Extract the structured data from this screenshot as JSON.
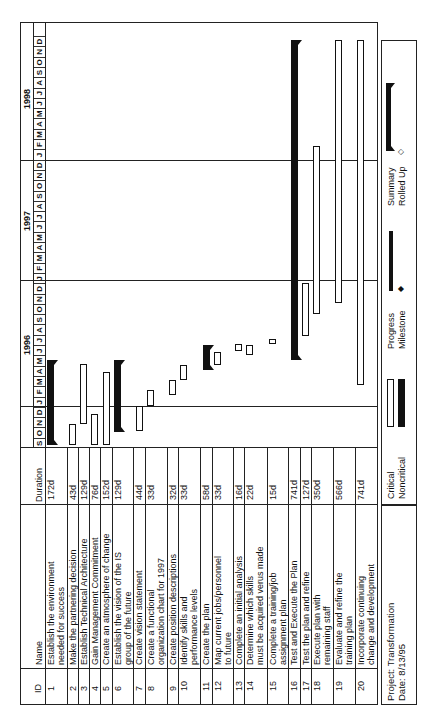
{
  "header": {
    "id_label": "ID",
    "name_label": "Name",
    "duration_label": "Duration",
    "years": [
      {
        "label": "1996",
        "start_month_index": 4
      },
      {
        "label": "1997",
        "start_month_index": 16
      },
      {
        "label": "1998",
        "start_month_index": 28
      }
    ],
    "months": [
      "S",
      "O",
      "N",
      "D",
      "J",
      "F",
      "M",
      "A",
      "M",
      "J",
      "J",
      "A",
      "S",
      "O",
      "N",
      "D",
      "J",
      "F",
      "M",
      "A",
      "M",
      "J",
      "J",
      "A",
      "S",
      "O",
      "N",
      "D",
      "J",
      "F",
      "M",
      "A",
      "M",
      "J",
      "J",
      "A",
      "S",
      "O",
      "N",
      "D"
    ]
  },
  "tasks": [
    {
      "id": "1",
      "name": [
        "Establish the environment",
        "needed for success"
      ],
      "duration": "172d",
      "type": "summary"
    },
    {
      "id": "2",
      "name": [
        "Make the partnering decision"
      ],
      "duration": "43d",
      "type": "task"
    },
    {
      "id": "3",
      "name": [
        "Establish Technical Architecture"
      ],
      "duration": "129d",
      "type": "task"
    },
    {
      "id": "4",
      "name": [
        "Gain Management Commitment"
      ],
      "duration": "76d",
      "type": "task"
    },
    {
      "id": "5",
      "name": [
        "Create an atmosphere of change"
      ],
      "duration": "152d",
      "type": "task"
    },
    {
      "id": "6",
      "name": [
        "Establish the vision of the IS",
        "group of the future"
      ],
      "duration": "129d",
      "type": "summary"
    },
    {
      "id": "7",
      "name": [
        "Create vision statement"
      ],
      "duration": "44d",
      "type": "task"
    },
    {
      "id": "8",
      "name": [
        "Create a functional",
        "organization chart for 1997"
      ],
      "duration": "33d",
      "type": "task"
    },
    {
      "id": "9",
      "name": [
        "Create position descriptions"
      ],
      "duration": "32d",
      "type": "task"
    },
    {
      "id": "10",
      "name": [
        "Identify skills and",
        "performance levels"
      ],
      "duration": "33d",
      "type": "task"
    },
    {
      "id": "11",
      "name": [
        "Create the plan"
      ],
      "duration": "58d",
      "type": "summary"
    },
    {
      "id": "12",
      "name": [
        "Map current jobs/personnel",
        "to future"
      ],
      "duration": "33d",
      "type": "task"
    },
    {
      "id": "13",
      "name": [
        "Complete an initial analysis"
      ],
      "duration": "16d",
      "type": "task"
    },
    {
      "id": "14",
      "name": [
        "Determine which skills",
        "must be acquired verus made"
      ],
      "duration": "22d",
      "type": "task"
    },
    {
      "id": "15",
      "name": [
        "Complete a training/job",
        "assignment plan"
      ],
      "duration": "15d",
      "type": "task"
    },
    {
      "id": "16",
      "name": [
        "Test and Execute the Plan"
      ],
      "duration": "741d",
      "type": "summary"
    },
    {
      "id": "17",
      "name": [
        "Test the plan and refine"
      ],
      "duration": "127d",
      "type": "task"
    },
    {
      "id": "18",
      "name": [
        "Execute plan with",
        "remaining staff"
      ],
      "duration": "350d",
      "type": "task"
    },
    {
      "id": "19",
      "name": [
        "Evaluate and refine the",
        "training plan"
      ],
      "duration": "566d",
      "type": "task"
    },
    {
      "id": "20",
      "name": [
        "Incorporate continuing",
        "change and development"
      ],
      "duration": "741d",
      "type": "task"
    }
  ],
  "footer": {
    "project": "Project: Transformation",
    "date": "Date: 8/13/95"
  },
  "legend": {
    "critical": "Critical",
    "noncritical": "Noncritical",
    "progress": "Progress",
    "milestone": "Milestone",
    "summary": "Summary",
    "rolled_up": "Rolled Up"
  },
  "colors": {
    "ink": "#111111",
    "background": "#ffffff"
  },
  "chart_data": {
    "type": "gantt",
    "title": "Project: Transformation",
    "date": "8/13/95",
    "timeline": {
      "start": "1995-09",
      "end": "1998-12",
      "unit": "month"
    },
    "categories": [
      "1",
      "2",
      "3",
      "4",
      "5",
      "6",
      "7",
      "8",
      "9",
      "10",
      "11",
      "12",
      "13",
      "14",
      "15",
      "16",
      "17",
      "18",
      "19",
      "20"
    ],
    "series": [
      {
        "id": "1",
        "task": "Establish the environment needed for success",
        "duration_days": 172,
        "start": "1995-09-01",
        "end": "1996-05-10",
        "summary": true
      },
      {
        "id": "2",
        "task": "Make the partnering decision",
        "duration_days": 43,
        "start": "1995-09-01",
        "end": "1995-11-01",
        "summary": false
      },
      {
        "id": "3",
        "task": "Establish Technical Architecture",
        "duration_days": 129,
        "start": "1995-11-01",
        "end": "1996-05-01",
        "summary": false
      },
      {
        "id": "4",
        "task": "Gain Management Commitment",
        "duration_days": 76,
        "start": "1995-09-01",
        "end": "1995-12-10",
        "summary": false
      },
      {
        "id": "5",
        "task": "Create an atmosphere of change",
        "duration_days": 152,
        "start": "1995-09-01",
        "end": "1996-04-05",
        "summary": false
      },
      {
        "id": "6",
        "task": "Establish the vision of the IS group of the future",
        "duration_days": 129,
        "start": "1995-10-10",
        "end": "1996-05-10",
        "summary": true
      },
      {
        "id": "7",
        "task": "Create vision statement",
        "duration_days": 44,
        "start": "1995-10-15",
        "end": "1995-12-15",
        "summary": false
      },
      {
        "id": "8",
        "task": "Create a functional organization chart for 1997",
        "duration_days": 33,
        "start": "1995-12-15",
        "end": "1996-02-01",
        "summary": false
      },
      {
        "id": "9",
        "task": "Create position descriptions",
        "duration_days": 32,
        "start": "1996-01-15",
        "end": "1996-03-01",
        "summary": false
      },
      {
        "id": "10",
        "task": "Identify skills and performance levels",
        "duration_days": 33,
        "start": "1996-03-01",
        "end": "1996-04-15",
        "summary": false
      },
      {
        "id": "11",
        "task": "Create the plan",
        "duration_days": 58,
        "start": "1996-04-01",
        "end": "1996-06-15",
        "summary": true
      },
      {
        "id": "12",
        "task": "Map current jobs/personnel to future",
        "duration_days": 33,
        "start": "1996-04-15",
        "end": "1996-06-01",
        "summary": false
      },
      {
        "id": "13",
        "task": "Complete an initial analysis",
        "duration_days": 16,
        "start": "1996-06-01",
        "end": "1996-06-20",
        "summary": false
      },
      {
        "id": "14",
        "task": "Determine which skills must be acquired verus made",
        "duration_days": 22,
        "start": "1996-05-20",
        "end": "1996-06-20",
        "summary": false
      },
      {
        "id": "15",
        "task": "Complete a training/job assignment plan",
        "duration_days": 15,
        "start": "1996-06-20",
        "end": "1996-07-10",
        "summary": false
      },
      {
        "id": "16",
        "task": "Test and Execute the Plan",
        "duration_days": 741,
        "start": "1996-05-10",
        "end": "1998-12-31",
        "summary": true
      },
      {
        "id": "17",
        "task": "Test the plan and refine",
        "duration_days": 127,
        "start": "1996-07-15",
        "end": "1997-01-15",
        "summary": false
      },
      {
        "id": "18",
        "task": "Execute plan with remaining staff",
        "duration_days": 350,
        "start": "1996-09-15",
        "end": "1998-01-15",
        "summary": false
      },
      {
        "id": "19",
        "task": "Evaluate and refine the training plan",
        "duration_days": 566,
        "start": "1996-10-15",
        "end": "1998-12-31",
        "summary": false
      },
      {
        "id": "20",
        "task": "Incorporate continuing change and development",
        "duration_days": 741,
        "start": "1996-02-01",
        "end": "1998-12-31",
        "summary": false
      }
    ],
    "legend": [
      "Critical",
      "Noncritical",
      "Progress",
      "Milestone",
      "Summary",
      "Rolled Up"
    ],
    "grid": {
      "year_dividers": true
    }
  }
}
